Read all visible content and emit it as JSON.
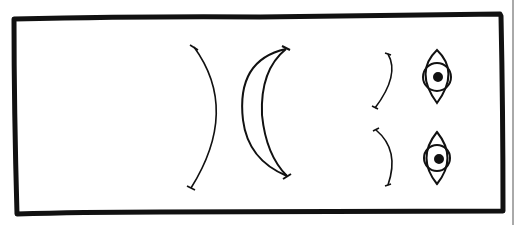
{
  "diagram": {
    "colors": {
      "ink": "#111111",
      "background": "#ffffff"
    },
    "frame": {
      "x": 13,
      "y": 18,
      "width": 490,
      "height": 196
    },
    "elements": [
      {
        "id": "concave-arc",
        "kind": "arc-right-bulge",
        "label": "single arc (lens surface)"
      },
      {
        "id": "crescent-lens",
        "kind": "crescent",
        "label": "crescent lens"
      },
      {
        "id": "small-arc-top",
        "kind": "arc-right-bulge",
        "label": "small arc (top)"
      },
      {
        "id": "small-arc-bottom",
        "kind": "arc-right-bulge",
        "label": "small arc (bottom)"
      },
      {
        "id": "eye-top",
        "kind": "eye-icon",
        "label": "eye (top)"
      },
      {
        "id": "eye-bottom",
        "kind": "eye-icon",
        "label": "eye (bottom)"
      }
    ]
  }
}
